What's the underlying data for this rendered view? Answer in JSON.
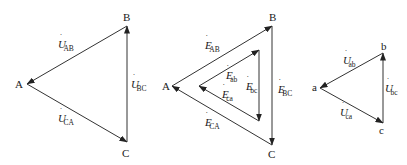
{
  "diagrams": [
    {
      "id": "line-voltage-triangle",
      "vertices": [
        {
          "label": "A",
          "x": 27,
          "y": 84,
          "lx": 15,
          "ly": 88
        },
        {
          "label": "B",
          "x": 127,
          "y": 26,
          "lx": 123,
          "ly": 21
        },
        {
          "label": "C",
          "x": 127,
          "y": 142,
          "lx": 122,
          "ly": 157
        }
      ],
      "edges": [
        {
          "from": "C",
          "to": "B",
          "symbol": "U",
          "sub": "BC",
          "lx": 131,
          "ly": 88
        },
        {
          "from": "B",
          "to": "A",
          "symbol": "U",
          "sub": "AB",
          "lx": 58,
          "ly": 48
        },
        {
          "from": "A",
          "to": "C",
          "symbol": "U",
          "sub": "CA",
          "lx": 58,
          "ly": 122
        }
      ]
    },
    {
      "id": "emf-triangles",
      "vertices": [
        {
          "label": "A",
          "x": 172,
          "y": 86,
          "lx": 162,
          "ly": 90
        },
        {
          "label": "B",
          "x": 272,
          "y": 26,
          "lx": 269,
          "ly": 21
        },
        {
          "label": "C",
          "x": 272,
          "y": 145,
          "lx": 268,
          "ly": 158
        }
      ],
      "edges": [
        {
          "from": "A",
          "to": "B",
          "symbol": "E",
          "sub": "AB",
          "lx": 205,
          "ly": 49
        },
        {
          "from": "B",
          "to": "C",
          "symbol": "E",
          "sub": "BC",
          "lx": 278,
          "ly": 93
        },
        {
          "from": "C",
          "to": "A",
          "symbol": "E",
          "sub": "CA",
          "lx": 205,
          "ly": 126
        }
      ],
      "inner_vertices": [
        {
          "id": "t",
          "x": 259,
          "y": 50
        },
        {
          "id": "l",
          "x": 199,
          "y": 86
        },
        {
          "id": "b",
          "x": 259,
          "y": 121
        }
      ],
      "inner_edges": [
        {
          "from": "l",
          "to": "t",
          "symbol": "E",
          "sub": "ab",
          "lx": 226,
          "ly": 79
        },
        {
          "from": "t",
          "to": "b",
          "symbol": "E",
          "sub": "bc",
          "lx": 246,
          "ly": 90
        },
        {
          "from": "b",
          "to": "l",
          "symbol": "E",
          "sub": "ca",
          "lx": 222,
          "ly": 98
        }
      ]
    },
    {
      "id": "phase-voltage-triangle",
      "vertices": [
        {
          "label": "a",
          "x": 320,
          "y": 88,
          "lx": 312,
          "ly": 91
        },
        {
          "label": "b",
          "x": 383,
          "y": 53,
          "lx": 381,
          "ly": 50
        },
        {
          "label": "c",
          "x": 383,
          "y": 123,
          "lx": 379,
          "ly": 134
        }
      ],
      "edges": [
        {
          "from": "c",
          "to": "b",
          "symbol": "U",
          "sub": "bc",
          "lx": 385,
          "ly": 92
        },
        {
          "from": "b",
          "to": "a",
          "symbol": "U",
          "sub": "ab",
          "lx": 343,
          "ly": 64
        },
        {
          "from": "a",
          "to": "c",
          "symbol": "U",
          "sub": "ca",
          "lx": 340,
          "ly": 116
        }
      ]
    }
  ],
  "colors": {
    "stroke": "#333333",
    "text": "#1a1a1a",
    "background": "#ffffff"
  }
}
